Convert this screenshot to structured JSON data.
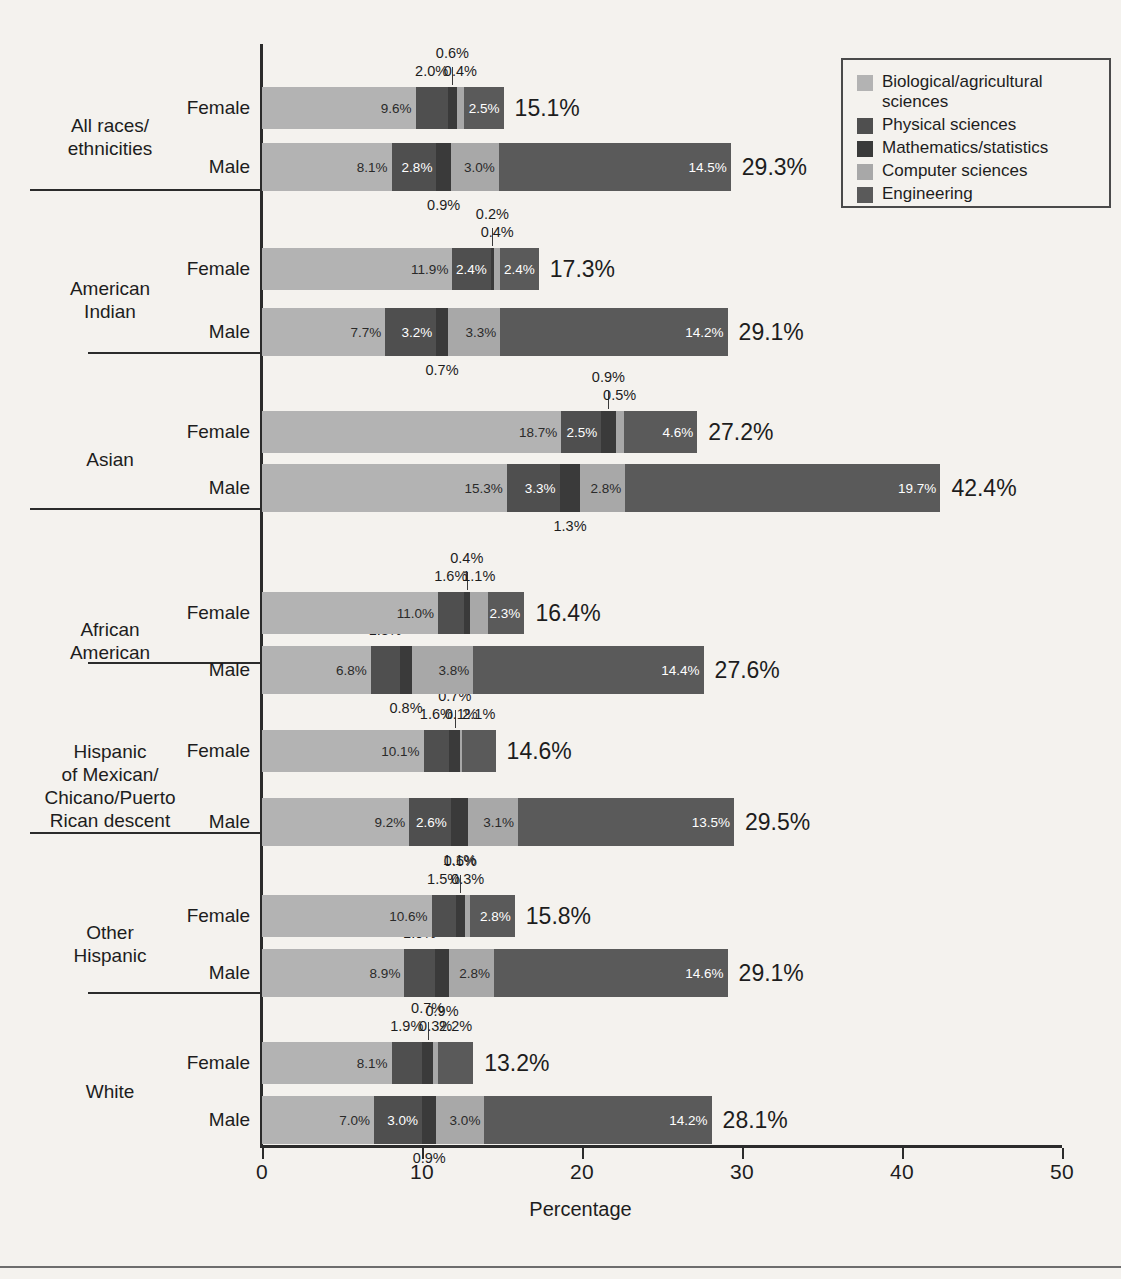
{
  "chart_data": {
    "type": "bar",
    "subtype": "horizontal-stacked",
    "title": "",
    "xlabel": "Percentage",
    "ylabel": "",
    "xlim": [
      0,
      50
    ],
    "xticks": [
      "0",
      "10",
      "20",
      "30",
      "40",
      "50"
    ],
    "grid": false,
    "legend_position": "top-right",
    "series": [
      {
        "name": "Biological/agricultural sciences",
        "color": "#b3b3b3"
      },
      {
        "name": "Physical sciences",
        "color": "#4f4f4f"
      },
      {
        "name": "Mathematics/statistics",
        "color": "#3a3a3a"
      },
      {
        "name": "Computer sciences",
        "color": "#a8a8a8"
      },
      {
        "name": "Engineering",
        "color": "#5a5a5a"
      }
    ],
    "groups": [
      {
        "label": "All races/\nethnicities",
        "rows": [
          {
            "label": "Female",
            "values": [
              9.6,
              2.0,
              0.6,
              0.4,
              2.5
            ],
            "value_labels": [
              "9.6%",
              "2.0%",
              "0.6%",
              "0.4%",
              "2.5%"
            ],
            "total": 15.1,
            "total_label": "15.1%"
          },
          {
            "label": "Male",
            "values": [
              8.1,
              2.8,
              0.9,
              3.0,
              14.5
            ],
            "value_labels": [
              "8.1%",
              "2.8%",
              "0.9%",
              "3.0%",
              "14.5%"
            ],
            "total": 29.3,
            "total_label": "29.3%"
          }
        ]
      },
      {
        "label": "American\nIndian",
        "rows": [
          {
            "label": "Female",
            "values": [
              11.9,
              2.4,
              0.2,
              0.4,
              2.4
            ],
            "value_labels": [
              "11.9%",
              "2.4%",
              "0.2%",
              "0.4%",
              "2.4%"
            ],
            "total": 17.3,
            "total_label": "17.3%"
          },
          {
            "label": "Male",
            "values": [
              7.7,
              3.2,
              0.7,
              3.3,
              14.2
            ],
            "value_labels": [
              "7.7%",
              "3.2%",
              "0.7%",
              "3.3%",
              "14.2%"
            ],
            "total": 29.1,
            "total_label": "29.1%"
          }
        ]
      },
      {
        "label": "Asian",
        "rows": [
          {
            "label": "Female",
            "values": [
              18.7,
              2.5,
              0.9,
              0.5,
              4.6
            ],
            "value_labels": [
              "18.7%",
              "2.5%",
              "0.9%",
              "0.5%",
              "4.6%"
            ],
            "total": 27.2,
            "total_label": "27.2%"
          },
          {
            "label": "Male",
            "values": [
              15.3,
              3.3,
              1.3,
              2.8,
              19.7
            ],
            "value_labels": [
              "15.3%",
              "3.3%",
              "1.3%",
              "2.8%",
              "19.7%"
            ],
            "total": 42.4,
            "total_label": "42.4%"
          }
        ]
      },
      {
        "label": "African\nAmerican",
        "rows": [
          {
            "label": "Female",
            "values": [
              11.0,
              1.6,
              0.4,
              1.1,
              2.3
            ],
            "value_labels": [
              "11.0%",
              "1.6%",
              "0.4%",
              "1.1%",
              "2.3%"
            ],
            "total": 16.4,
            "total_label": "16.4%"
          },
          {
            "label": "Male",
            "values": [
              6.8,
              1.8,
              0.8,
              3.8,
              14.4
            ],
            "value_labels": [
              "6.8%",
              "1.8%",
              "0.8%",
              "3.8%",
              "14.4%"
            ],
            "total": 27.6,
            "total_label": "27.6%"
          }
        ]
      },
      {
        "label": "Hispanic\nof Mexican/\nChicano/Puerto\nRican descent",
        "rows": [
          {
            "label": "Female",
            "values": [
              10.1,
              1.6,
              0.7,
              0.1,
              2.1
            ],
            "value_labels": [
              "10.1%",
              "1.6%",
              "0.7%",
              "0.1%",
              "2.1%"
            ],
            "total": 14.6,
            "total_label": "14.6%"
          },
          {
            "label": "Male",
            "values": [
              9.2,
              2.6,
              1.1,
              3.1,
              13.5
            ],
            "value_labels": [
              "9.2%",
              "2.6%",
              "1.1%",
              "3.1%",
              "13.5%"
            ],
            "total": 29.5,
            "total_label": "29.5%"
          }
        ]
      },
      {
        "label": "Other\nHispanic",
        "rows": [
          {
            "label": "Female",
            "values": [
              10.6,
              1.5,
              0.6,
              0.3,
              2.8
            ],
            "value_labels": [
              "10.6%",
              "1.5%",
              "0.6%",
              "0.3%",
              "2.8%"
            ],
            "total": 15.8,
            "total_label": "15.8%"
          },
          {
            "label": "Male",
            "values": [
              8.9,
              1.9,
              0.9,
              2.8,
              14.6
            ],
            "value_labels": [
              "8.9%",
              "1.9%",
              "0.9%",
              "2.8%",
              "14.6%"
            ],
            "total": 29.1,
            "total_label": "29.1%"
          }
        ]
      },
      {
        "label": "White",
        "rows": [
          {
            "label": "Female",
            "values": [
              8.1,
              1.9,
              0.7,
              0.3,
              2.2
            ],
            "value_labels": [
              "8.1%",
              "1.9%",
              "0.7%",
              "0.3%",
              "2.2%"
            ],
            "total": 13.2,
            "total_label": "13.2%"
          },
          {
            "label": "Male",
            "values": [
              7.0,
              3.0,
              0.9,
              3.0,
              14.2
            ],
            "value_labels": [
              "7.0%",
              "3.0%",
              "0.9%",
              "3.0%",
              "14.2%"
            ],
            "total": 28.1,
            "total_label": "28.1%"
          }
        ]
      }
    ]
  },
  "legend": {
    "items": [
      "Biological/agricultural sciences",
      "Physical sciences",
      "Mathematics/statistics",
      "Computer sciences",
      "Engineering"
    ]
  },
  "axis": {
    "x_title": "Percentage"
  }
}
